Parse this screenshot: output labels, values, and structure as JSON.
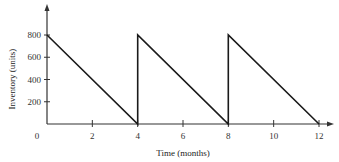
{
  "chart_data": {
    "type": "line",
    "title": "",
    "xlabel": "Time (months)",
    "ylabel": "Inventory (units)",
    "x_ticks": [
      2,
      4,
      6,
      8,
      10,
      12
    ],
    "y_ticks": [
      200,
      400,
      600,
      800
    ],
    "origin_label": "0",
    "xlim": [
      0,
      12
    ],
    "ylim": [
      0,
      800
    ],
    "grid": false,
    "legend": null,
    "series": [
      {
        "name": "Inventory",
        "x": [
          0,
          4,
          4,
          8,
          8,
          12
        ],
        "y": [
          800,
          0,
          800,
          0,
          800,
          0
        ]
      }
    ]
  },
  "colors": {
    "line": "#1a1a1a",
    "axis": "#333333"
  }
}
